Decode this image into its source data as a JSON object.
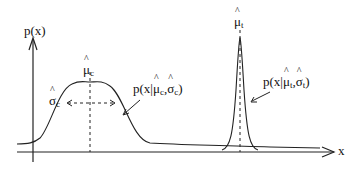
{
  "diagram": {
    "y_axis_label": "p(x)",
    "x_axis_label": "x",
    "curves": [
      {
        "name": "wide",
        "mean_label": "μ",
        "mean_sub": "c",
        "sigma_label": "σ",
        "sigma_sub": "c",
        "annotation": {
          "prefix": "p(x|",
          "mu": "μ",
          "mu_sub": "c",
          "sep": ",",
          "sigma": "σ",
          "sigma_sub": "c",
          "suffix": ")"
        }
      },
      {
        "name": "narrow",
        "mean_label": "μ",
        "mean_sub": "t",
        "annotation": {
          "prefix": "p(x|",
          "mu": "μ",
          "mu_sub": "t",
          "sep": ",",
          "sigma": "σ",
          "sigma_sub": "t",
          "suffix": ")"
        }
      }
    ],
    "colors": {
      "stroke": "#222222",
      "background": "#ffffff"
    }
  }
}
